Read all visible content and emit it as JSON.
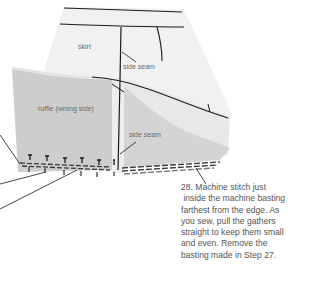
{
  "diagram": {
    "labels": {
      "skirt": "skirt",
      "side_seam_upper": "side seam",
      "ruffle": "ruffle (wrong side)",
      "side_seam_lower": "side seam"
    },
    "caption": {
      "lines": [
        "28. Machine stitch just",
        " inside the machine basting",
        "farthest from the edge. As",
        "you sew, pull the gathers",
        "straight to keep them small",
        "and even. Remove the",
        "basting made in Step 27."
      ]
    },
    "colors": {
      "skirt_fill": "#f2f2f2",
      "ruffle_fill": "#cfcfcf",
      "ruffle_light": "#e2e2e2",
      "line": "#1a1a1a",
      "label_text": "#6a6a6a",
      "caption_text": "#555555"
    },
    "pin_count": 6
  }
}
